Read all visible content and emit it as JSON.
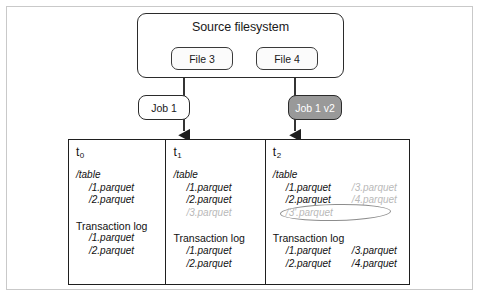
{
  "source_filesystem": {
    "title": "Source filesystem",
    "files": [
      {
        "label": "File 3"
      },
      {
        "label": "File 4"
      }
    ]
  },
  "jobs": [
    {
      "label": "Job 1",
      "style": "plain"
    },
    {
      "label": "Job 1 v2",
      "style": "shaded"
    }
  ],
  "timeline": {
    "columns": [
      {
        "time_letter": "t",
        "time_index": "0",
        "table_heading": "/table",
        "table_files": [
          {
            "name": "/1.parquet",
            "muted": false
          },
          {
            "name": "/2.parquet",
            "muted": false
          }
        ],
        "log_heading": "Transaction log",
        "log_files": [
          {
            "name": "/1.parquet",
            "muted": false
          },
          {
            "name": "/2.parquet",
            "muted": false
          }
        ]
      },
      {
        "time_letter": "t",
        "time_index": "1",
        "table_heading": "/table",
        "table_files": [
          {
            "name": "/1.parquet",
            "muted": false
          },
          {
            "name": "/2.parquet",
            "muted": false
          },
          {
            "name": "/3.parquet",
            "muted": true
          }
        ],
        "log_heading": "Transaction log",
        "log_files": [
          {
            "name": "/1.parquet",
            "muted": false
          },
          {
            "name": "/2.parquet",
            "muted": false
          }
        ]
      },
      {
        "time_letter": "t",
        "time_index": "2",
        "table_heading": "/table",
        "table_rows": [
          {
            "left": "/1.parquet",
            "left_muted": false,
            "right": "/3.parquet",
            "right_muted": true
          },
          {
            "left": "/2.parquet",
            "left_muted": false,
            "right": "/4.parquet",
            "right_muted": true
          }
        ],
        "circled_file": "/3'.parquet",
        "log_heading": "Transaction log",
        "log_rows": [
          {
            "left": "/1.parquet",
            "right": "/3.parquet"
          },
          {
            "left": "/2.parquet",
            "right": "/4.parquet"
          }
        ]
      }
    ]
  },
  "colors": {
    "outer_frame": "#c9c9c9",
    "node_border": "#2b2b2b",
    "table_border": "#1f1f1f",
    "shaded_job_fill": "#999999",
    "shaded_job_text": "#ffffff",
    "muted_text": "#b9b9b9",
    "body_text": "#111111",
    "circle_stroke": "#8d8d8d",
    "connector": "#1f1f1f"
  }
}
